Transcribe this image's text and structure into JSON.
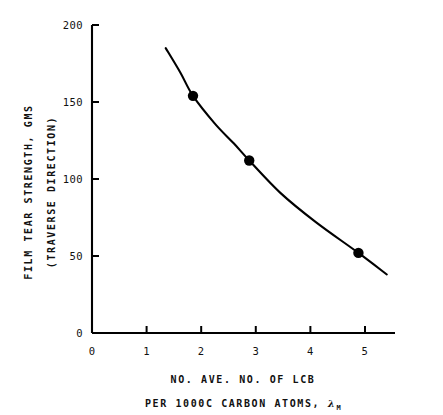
{
  "chart_data": {
    "type": "line",
    "title": "",
    "xlabel_lines": [
      "NO. AVE. NO. OF LCB",
      "PER 1000C CARBON ATOMS, "
    ],
    "xlabel_symbol": "λ",
    "xlabel_symbol_subscript": "M",
    "ylabel_lines": [
      "FILM TEAR STRENGTH, GMS",
      "(TRAVERSE DIRECTION)"
    ],
    "xlim": [
      0,
      5.55
    ],
    "ylim": [
      0,
      200
    ],
    "xticks": [
      0,
      1,
      2,
      3,
      4,
      5
    ],
    "xtick_labels": [
      "0",
      "1",
      "2",
      "3",
      "4",
      "5"
    ],
    "yticks": [
      0,
      50,
      100,
      150,
      200
    ],
    "ytick_labels": [
      "0",
      "50",
      "100",
      "150",
      "200"
    ],
    "grid": false,
    "legend": "none",
    "series": [
      {
        "name": "film tear strength vs LCB",
        "marker": "filled-circle",
        "marker_color": "#000000",
        "line_color": "#000000",
        "points": [
          {
            "x": 1.85,
            "y": 154
          },
          {
            "x": 2.88,
            "y": 112
          },
          {
            "x": 4.88,
            "y": 52
          }
        ],
        "curve": [
          {
            "x": 1.35,
            "y": 185
          },
          {
            "x": 1.62,
            "y": 169
          },
          {
            "x": 1.85,
            "y": 154
          },
          {
            "x": 2.25,
            "y": 136
          },
          {
            "x": 2.6,
            "y": 123
          },
          {
            "x": 2.88,
            "y": 112
          },
          {
            "x": 3.45,
            "y": 91
          },
          {
            "x": 4.1,
            "y": 72
          },
          {
            "x": 4.88,
            "y": 52
          },
          {
            "x": 5.4,
            "y": 38
          }
        ]
      }
    ]
  },
  "figure": {
    "background_color": "#ffffff",
    "axis_color": "#000000",
    "text_color": "#111111"
  }
}
